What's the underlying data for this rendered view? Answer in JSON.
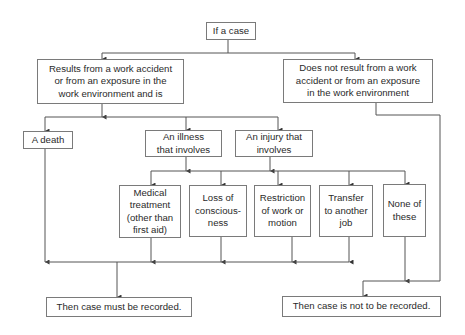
{
  "diagram": {
    "type": "flowchart",
    "colors": {
      "line": "#555555",
      "border": "#7a7a7a",
      "text": "#2a2a2a",
      "background": "#ffffff"
    },
    "nodes": {
      "start": "If a case",
      "work_related": "Results from a work accident or from an exposure in the work environment and is",
      "not_work_related": "Does not result from a work accident or from an exposure in the work environment",
      "death": "A death",
      "illness": "An illness that involves",
      "injury": "An injury that involves",
      "medical_treatment": "Medical treatment (other than first aid)",
      "loss_of_consciousness": "Loss of consciousness",
      "restriction": "Restriction of work or motion",
      "transfer": "Transfer to another job",
      "none": "None of these",
      "must_record": "Then case must be recorded.",
      "not_record": "Then case is not to be recorded."
    },
    "lines": {
      "start": [
        "If a case"
      ],
      "work_related": [
        "Results from a work accident",
        "or from an exposure in the",
        "work environment and is"
      ],
      "not_work_related": [
        "Does not result from a work",
        "accident or from an exposure",
        "in the work environment"
      ],
      "death": [
        "A death"
      ],
      "illness": [
        "An illness",
        "that involves"
      ],
      "injury": [
        "An injury that",
        "involves"
      ],
      "medical_treatment": [
        "Medical",
        "treatment",
        "(other than",
        "first aid)"
      ],
      "loss_of_consciousness": [
        "Loss of",
        "conscious-",
        "ness"
      ],
      "restriction": [
        "Restriction",
        "of work or",
        "motion"
      ],
      "transfer": [
        "Transfer",
        "to another",
        "job"
      ],
      "none": [
        "None of",
        "these"
      ],
      "must_record": [
        "Then case must be recorded."
      ],
      "not_record": [
        "Then case is not to be recorded."
      ]
    },
    "edges": [
      [
        "start",
        "work_related"
      ],
      [
        "start",
        "not_work_related"
      ],
      [
        "work_related",
        "death"
      ],
      [
        "work_related",
        "illness"
      ],
      [
        "work_related",
        "injury"
      ],
      [
        "illness",
        "medical_treatment"
      ],
      [
        "illness",
        "loss_of_consciousness"
      ],
      [
        "illness",
        "restriction"
      ],
      [
        "illness",
        "transfer"
      ],
      [
        "illness",
        "none"
      ],
      [
        "injury",
        "medical_treatment"
      ],
      [
        "injury",
        "loss_of_consciousness"
      ],
      [
        "injury",
        "restriction"
      ],
      [
        "injury",
        "transfer"
      ],
      [
        "injury",
        "none"
      ],
      [
        "death",
        "must_record"
      ],
      [
        "medical_treatment",
        "must_record"
      ],
      [
        "loss_of_consciousness",
        "must_record"
      ],
      [
        "restriction",
        "must_record"
      ],
      [
        "transfer",
        "must_record"
      ],
      [
        "none",
        "not_record"
      ],
      [
        "not_work_related",
        "not_record"
      ]
    ]
  }
}
